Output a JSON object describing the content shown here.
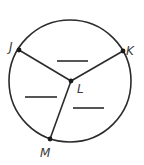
{
  "diagram": {
    "type": "circle-with-radii",
    "colors": {
      "stroke": "#2b2b2b",
      "background": "#ffffff",
      "label": "#3a3a3a"
    },
    "circle": {
      "cx": 70,
      "cy": 81,
      "r": 61
    },
    "center": {
      "label": "L",
      "x": 71,
      "y": 81
    },
    "points": [
      {
        "label": "J",
        "x": 19,
        "y": 50
      },
      {
        "label": "K",
        "x": 123,
        "y": 51
      },
      {
        "label": "M",
        "x": 50,
        "y": 139
      }
    ],
    "radii": [
      "LJ",
      "LK",
      "LM"
    ],
    "blanks": [
      {
        "region": "between J and K",
        "x1": 57,
        "x2": 88,
        "y": 61
      },
      {
        "region": "between J and M",
        "x1": 25,
        "x2": 57,
        "y": 97
      },
      {
        "region": "between K and M",
        "x1": 73,
        "x2": 104,
        "y": 108
      }
    ],
    "labels": {
      "J": "J",
      "K": "K",
      "L": "L",
      "M": "M"
    }
  }
}
